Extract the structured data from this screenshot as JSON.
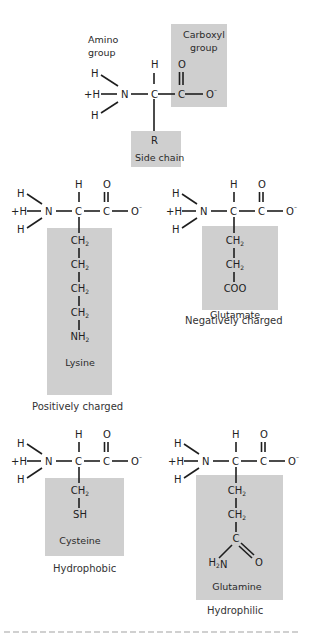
{
  "diagram": {
    "box_color": "#cfcfcf",
    "general": {
      "amino_group_label": [
        "Amino",
        "group"
      ],
      "carboxyl_group_label": [
        "Carboxyl",
        "group"
      ],
      "side_chain_symbol": "R",
      "side_chain_label": "Side chain"
    },
    "backbone_atoms": {
      "h": "H",
      "plus_h": "+H",
      "n": "N",
      "c": "C",
      "o": "O",
      "o_minus": "O",
      "minus": "–"
    },
    "amino_acids": [
      {
        "name": "Lysine",
        "category": "Positively charged",
        "side_chain": [
          "CH2",
          "CH2",
          "CH2",
          "CH2",
          "NH2"
        ]
      },
      {
        "name": "Glutamate",
        "category": "Negatively charged",
        "side_chain": [
          "CH2",
          "CH2",
          "COO"
        ]
      },
      {
        "name": "Cysteine",
        "category": "Hydrophobic",
        "side_chain": [
          "CH2",
          "SH"
        ]
      },
      {
        "name": "Glutamine",
        "category": "Hydrophilic",
        "side_chain": [
          "CH2",
          "CH2",
          "C",
          "H2N",
          "O"
        ]
      }
    ]
  }
}
